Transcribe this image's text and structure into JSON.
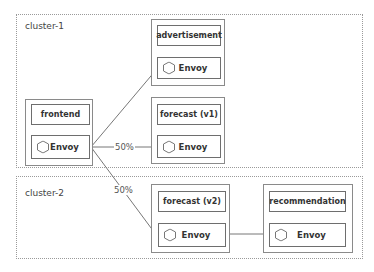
{
  "clusters": [
    {
      "id": "cluster-1",
      "label": "cluster-1"
    },
    {
      "id": "cluster-2",
      "label": "cluster-2"
    }
  ],
  "pods": {
    "frontend": {
      "service": "frontend",
      "proxy": "Envoy"
    },
    "advertisement": {
      "service": "advertisement",
      "proxy": "Envoy"
    },
    "forecast_v1": {
      "service": "forecast  (v1)",
      "proxy": "Envoy"
    },
    "forecast_v2": {
      "service": "forecast  (v2)",
      "proxy": "Envoy"
    },
    "recommendation": {
      "service": "recommendation",
      "proxy": "Envoy"
    }
  },
  "edges": [
    {
      "from": "frontend",
      "to": "advertisement",
      "label": ""
    },
    {
      "from": "frontend",
      "to": "forecast_v1",
      "label": "50%"
    },
    {
      "from": "frontend",
      "to": "forecast_v2",
      "label": "50%"
    },
    {
      "from": "forecast_v2",
      "to": "recommendation",
      "label": ""
    }
  ],
  "colors": {
    "border": "#8a8a8a",
    "inner_border": "#6e6e6e",
    "line": "#777777",
    "text": "#333333"
  }
}
